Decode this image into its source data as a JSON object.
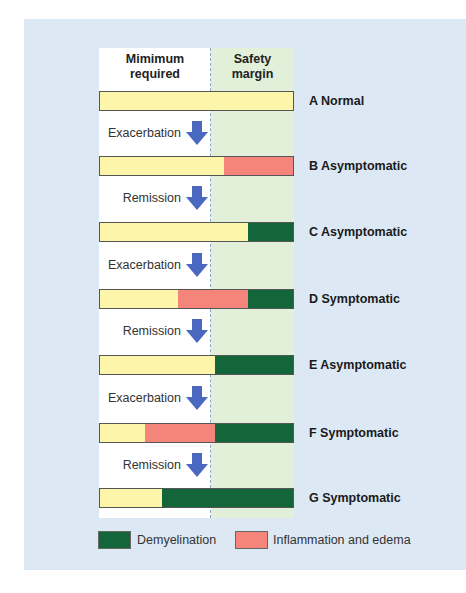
{
  "colors": {
    "panel_bg": "#dce9f5",
    "normal": "#fdf5a9",
    "inflammation": "#f5857a",
    "demyelination": "#12663a",
    "safety_margin_bg": "#e2efd9",
    "arrow": "#4a68c0"
  },
  "headers": {
    "minimum_required": [
      "Mimimum",
      "required"
    ],
    "safety_margin": [
      "Safety",
      "margin"
    ]
  },
  "rows": [
    {
      "id": "A",
      "label": "A Normal",
      "top": 91,
      "segments": [
        {
          "type": "normal",
          "width": 193
        }
      ]
    },
    {
      "id": "B",
      "label": "B Asymptomatic",
      "top": 156,
      "segments": [
        {
          "type": "normal",
          "width": 124
        },
        {
          "type": "inflammation",
          "width": 69
        }
      ]
    },
    {
      "id": "C",
      "label": "C Asymptomatic",
      "top": 222,
      "segments": [
        {
          "type": "normal",
          "width": 148
        },
        {
          "type": "demyelination",
          "width": 45
        }
      ]
    },
    {
      "id": "D",
      "label": "D Symptomatic",
      "top": 289,
      "segments": [
        {
          "type": "normal",
          "width": 78
        },
        {
          "type": "inflammation",
          "width": 70
        },
        {
          "type": "demyelination",
          "width": 45
        }
      ]
    },
    {
      "id": "E",
      "label": "E Asymptomatic",
      "top": 355,
      "segments": [
        {
          "type": "normal",
          "width": 115
        },
        {
          "type": "demyelination",
          "width": 78
        }
      ]
    },
    {
      "id": "F",
      "label": "F Symptomatic",
      "top": 423,
      "segments": [
        {
          "type": "normal",
          "width": 45
        },
        {
          "type": "inflammation",
          "width": 70
        },
        {
          "type": "demyelination",
          "width": 78
        }
      ]
    },
    {
      "id": "G",
      "label": "G Symptomatic",
      "top": 488,
      "segments": [
        {
          "type": "normal",
          "width": 62
        },
        {
          "type": "demyelination",
          "width": 131
        }
      ]
    }
  ],
  "transitions": [
    {
      "label": "Exacerbation",
      "top": 125
    },
    {
      "label": "Remission",
      "top": 190
    },
    {
      "label": "Exacerbation",
      "top": 257
    },
    {
      "label": "Remission",
      "top": 323
    },
    {
      "label": "Exacerbation",
      "top": 390
    },
    {
      "label": "Remission",
      "top": 457
    }
  ],
  "legend": {
    "demyelination": "Demyelination",
    "inflammation": "Inflammation and edema"
  }
}
